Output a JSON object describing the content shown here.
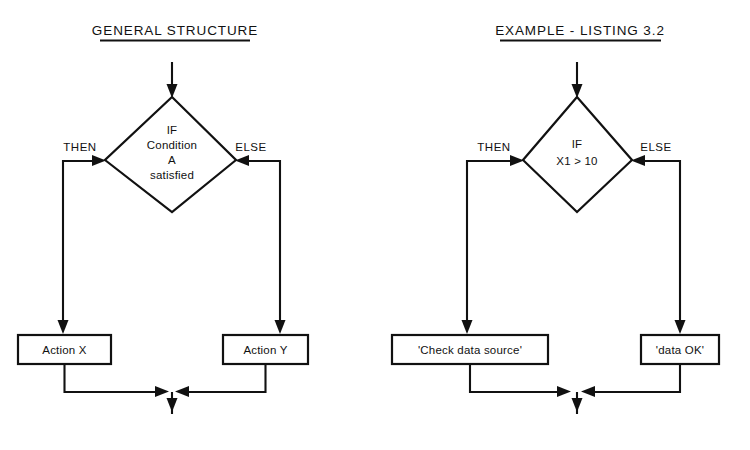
{
  "figure": {
    "type": "flowchart",
    "background_color": "#ffffff",
    "line_color": "#111111"
  },
  "panels": [
    {
      "id": "general-structure",
      "title": "GENERAL STRUCTURE",
      "title_underlined": true,
      "entry": {
        "label": "",
        "arrow": "down"
      },
      "decision": {
        "shape": "diamond",
        "lines": [
          "IF",
          "Condition",
          "A",
          "satisfied"
        ],
        "text": "IF Condition A satisfied"
      },
      "branches": [
        {
          "label": "THEN",
          "side": "left",
          "action": {
            "shape": "rectangle",
            "text": "Action X"
          }
        },
        {
          "label": "ELSE",
          "side": "right",
          "action": {
            "shape": "rectangle",
            "text": "Action Y"
          }
        }
      ],
      "merge": {
        "label": "",
        "exit_arrow": "down"
      }
    },
    {
      "id": "example-listing",
      "title": "EXAMPLE - LISTING 3.2",
      "title_underlined": true,
      "entry": {
        "label": "",
        "arrow": "down"
      },
      "decision": {
        "shape": "diamond",
        "lines": [
          "IF",
          "X1 > 10"
        ],
        "text": "IF X1 > 10"
      },
      "branches": [
        {
          "label": "THEN",
          "side": "left",
          "action": {
            "shape": "rectangle",
            "text": "'Check data source'"
          }
        },
        {
          "label": "ELSE",
          "side": "right",
          "action": {
            "shape": "rectangle",
            "text": "'data OK'"
          }
        }
      ],
      "merge": {
        "label": "",
        "exit_arrow": "down"
      }
    }
  ]
}
